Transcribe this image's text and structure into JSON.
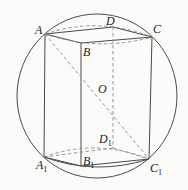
{
  "diagram": {
    "type": "geometry",
    "labels": {
      "A": "A",
      "B": "B",
      "C": "C",
      "D": "D",
      "O": "O",
      "A1": "A",
      "B1": "B",
      "C1": "C",
      "D1": "D",
      "sub": "1"
    },
    "points": {
      "A": [
        45,
        34
      ],
      "B": [
        81,
        43
      ],
      "C": [
        152,
        37
      ],
      "D": [
        113,
        27
      ],
      "A1": [
        44,
        157
      ],
      "B1": [
        81,
        166
      ],
      "C1": [
        149,
        159
      ],
      "D1": [
        113,
        148
      ],
      "O": [
        97,
        96
      ]
    },
    "sphere": {
      "cx": 97,
      "cy": 96,
      "rx": 80,
      "ry": 82
    },
    "colors": {
      "line": "#4a4a4a",
      "hidden": "#8a8a8a",
      "text": "#1a1a1a",
      "background": "#fbfbfa"
    }
  }
}
